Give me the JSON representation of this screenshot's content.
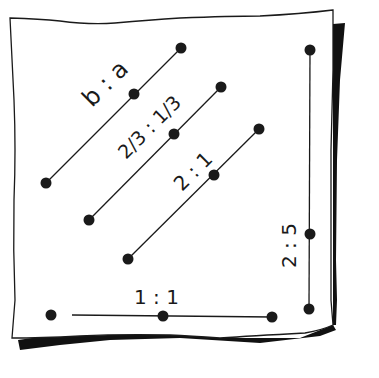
{
  "figure": {
    "colors": {
      "ink": "#1a1a1a",
      "paper": "#ffffff",
      "shadow": "#111111"
    }
  },
  "segments": [
    {
      "id": "ba",
      "label": "b : a",
      "points": [
        [
          46,
          183
        ],
        [
          134,
          94
        ],
        [
          181,
          48
        ]
      ]
    },
    {
      "id": "two-thirds",
      "label": "2/3 : 1/3",
      "points": [
        [
          89,
          220
        ],
        [
          174,
          134
        ],
        [
          221,
          87
        ]
      ]
    },
    {
      "id": "two-one",
      "label": "2 : 1",
      "points": [
        [
          128,
          259
        ],
        [
          214,
          175
        ],
        [
          259,
          129
        ]
      ]
    },
    {
      "id": "two-five",
      "label": "2 : 5",
      "points": [
        [
          310,
          50
        ],
        [
          310,
          234
        ],
        [
          309,
          309
        ]
      ]
    },
    {
      "id": "one-one",
      "label": "1 : 1",
      "points": [
        [
          51,
          315
        ],
        [
          163,
          316
        ],
        [
          272,
          317
        ]
      ]
    }
  ],
  "labels": {
    "ba": "b : a",
    "two_thirds": "2/3 : 1/3",
    "two_one": "2 : 1",
    "two_five": "2 : 5",
    "one_one": "1 : 1"
  }
}
